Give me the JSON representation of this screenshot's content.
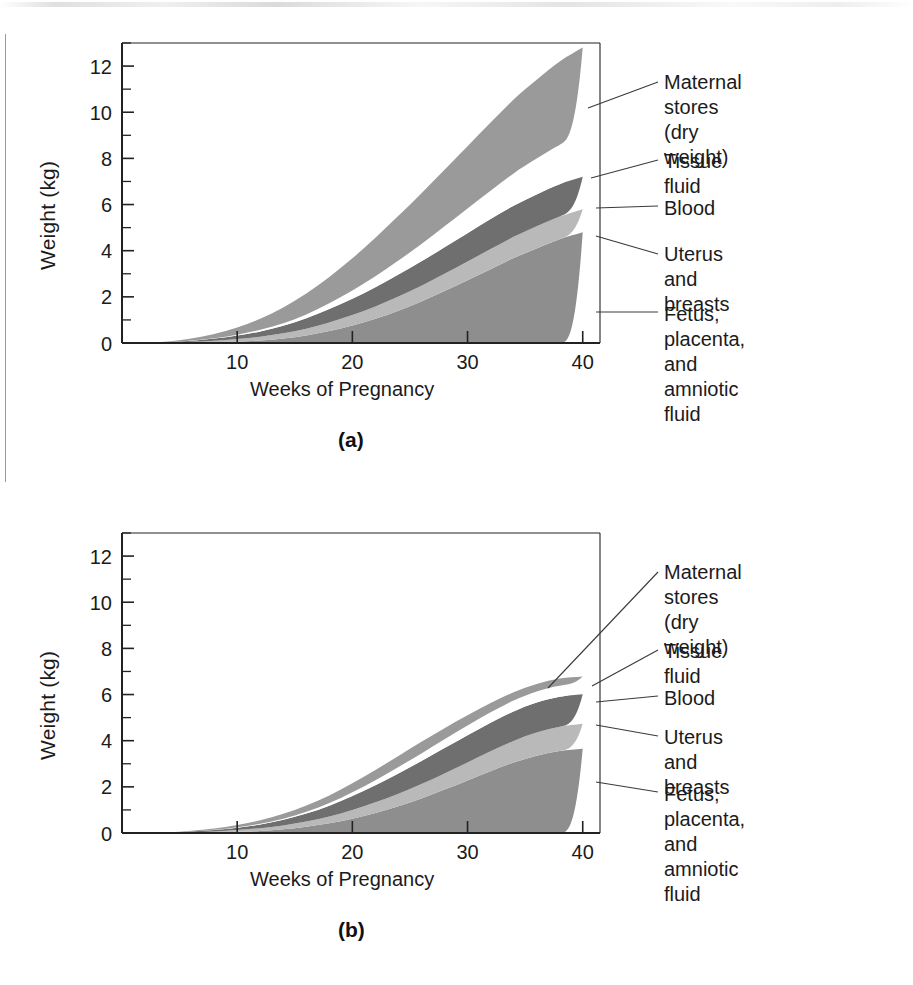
{
  "figure": {
    "panels": [
      {
        "id": "a",
        "caption": "(a)",
        "xlabel": "Weeks of Pregnancy",
        "ylabel": "Weight (kg)"
      },
      {
        "id": "b",
        "caption": "(b)",
        "xlabel": "Weeks of Pregnancy",
        "ylabel": "Weight (kg)"
      }
    ]
  },
  "legend": {
    "entries": [
      {
        "label": "Maternal stores\n(dry weight)",
        "key": "maternal-stores"
      },
      {
        "label": "Tissue fluid",
        "key": "tissue-fluid"
      },
      {
        "label": "Blood",
        "key": "blood"
      },
      {
        "label": "Uterus and breasts",
        "key": "uterus-and-breasts"
      },
      {
        "label": "Fetus, placenta, and\namniotic fluid",
        "key": "fetus-placenta-amniotic-fluid"
      }
    ]
  },
  "colors": {
    "fetus": "#8e8e8e",
    "uterus": "#b9b9b9",
    "blood": "#6f6f6f",
    "tissue_fluid": "#ffffff",
    "maternal_stores": "#9a9a9a",
    "axis": "#222222",
    "text": "#1b1b1b"
  },
  "chart_data": [
    {
      "type": "area",
      "stacked": true,
      "panel": "a",
      "title": "",
      "xlabel": "Weeks of Pregnancy",
      "ylabel": "Weight (kg)",
      "xlim": [
        0,
        41.5
      ],
      "ylim": [
        0,
        13
      ],
      "xticks": [
        10,
        20,
        30,
        40
      ],
      "xtick_labels": [
        "10",
        "20",
        "30",
        "40"
      ],
      "yticks": [
        0,
        2,
        4,
        6,
        8,
        10,
        12
      ],
      "ytick_labels": [
        "0",
        "2",
        "4",
        "6",
        "8",
        "10",
        "12"
      ],
      "y_minor_ticks": [
        1,
        3,
        5,
        7,
        9,
        11,
        13
      ],
      "grid": false,
      "legend_position": "right-outside",
      "x": [
        0,
        4,
        6,
        8,
        10,
        12,
        14,
        16,
        18,
        20,
        22,
        24,
        26,
        28,
        30,
        32,
        34,
        36,
        38,
        40
      ],
      "series": [
        {
          "name": "Fetus, placenta, and amniotic fluid",
          "values": [
            0,
            0,
            0.01,
            0.03,
            0.06,
            0.11,
            0.2,
            0.33,
            0.52,
            0.76,
            1.05,
            1.4,
            1.8,
            2.25,
            2.72,
            3.2,
            3.68,
            4.1,
            4.5,
            4.8
          ]
        },
        {
          "name": "Uterus and breasts",
          "values": [
            0,
            0.02,
            0.04,
            0.07,
            0.11,
            0.16,
            0.22,
            0.29,
            0.37,
            0.45,
            0.53,
            0.61,
            0.68,
            0.75,
            0.81,
            0.87,
            0.92,
            0.96,
            0.98,
            1.0
          ]
        },
        {
          "name": "Blood",
          "values": [
            0,
            0.02,
            0.05,
            0.09,
            0.15,
            0.23,
            0.33,
            0.45,
            0.58,
            0.71,
            0.84,
            0.96,
            1.06,
            1.15,
            1.23,
            1.3,
            1.35,
            1.38,
            1.4,
            1.4
          ]
        },
        {
          "name": "Tissue fluid",
          "values": [
            0,
            0,
            0.01,
            0.02,
            0.04,
            0.07,
            0.11,
            0.17,
            0.25,
            0.35,
            0.47,
            0.6,
            0.75,
            0.91,
            1.07,
            1.23,
            1.4,
            1.55,
            1.7,
            1.8
          ]
        },
        {
          "name": "Maternal stores (dry weight)",
          "values": [
            0,
            0.03,
            0.09,
            0.18,
            0.31,
            0.48,
            0.68,
            0.9,
            1.14,
            1.4,
            1.67,
            1.94,
            2.2,
            2.45,
            2.7,
            2.95,
            3.2,
            3.42,
            3.62,
            3.8
          ]
        }
      ],
      "total_at_40": 12.8
    },
    {
      "type": "area",
      "stacked": true,
      "panel": "b",
      "title": "",
      "xlabel": "Weeks of Pregnancy",
      "ylabel": "Weight (kg)",
      "xlim": [
        0,
        41.5
      ],
      "ylim": [
        0,
        13
      ],
      "xticks": [
        10,
        20,
        30,
        40
      ],
      "xtick_labels": [
        "10",
        "20",
        "30",
        "40"
      ],
      "yticks": [
        0,
        2,
        4,
        6,
        8,
        10,
        12
      ],
      "ytick_labels": [
        "0",
        "2",
        "4",
        "6",
        "8",
        "10",
        "12"
      ],
      "y_minor_ticks": [
        1,
        3,
        5,
        7,
        9,
        11,
        13
      ],
      "grid": false,
      "legend_position": "right-outside",
      "x": [
        0,
        4,
        6,
        8,
        10,
        12,
        14,
        16,
        18,
        20,
        22,
        24,
        26,
        28,
        30,
        32,
        34,
        36,
        38,
        40
      ],
      "series": [
        {
          "name": "Fetus, placenta, and amniotic fluid",
          "values": [
            0,
            0,
            0.01,
            0.02,
            0.05,
            0.09,
            0.16,
            0.27,
            0.42,
            0.62,
            0.87,
            1.16,
            1.5,
            1.88,
            2.28,
            2.68,
            3.05,
            3.35,
            3.55,
            3.65
          ]
        },
        {
          "name": "Uterus and breasts",
          "values": [
            0,
            0.01,
            0.03,
            0.05,
            0.08,
            0.12,
            0.17,
            0.23,
            0.3,
            0.38,
            0.46,
            0.54,
            0.62,
            0.7,
            0.78,
            0.86,
            0.94,
            1.0,
            1.05,
            1.08
          ]
        },
        {
          "name": "Blood",
          "values": [
            0,
            0.01,
            0.03,
            0.06,
            0.1,
            0.16,
            0.24,
            0.34,
            0.46,
            0.6,
            0.74,
            0.88,
            1.0,
            1.1,
            1.18,
            1.24,
            1.28,
            1.3,
            1.3,
            1.28
          ]
        },
        {
          "name": "Tissue fluid",
          "values": [
            0,
            0,
            0.0,
            0.01,
            0.02,
            0.03,
            0.05,
            0.08,
            0.12,
            0.17,
            0.22,
            0.28,
            0.33,
            0.38,
            0.42,
            0.45,
            0.47,
            0.48,
            0.48,
            0.47
          ]
        },
        {
          "name": "Maternal stores (dry weight)",
          "values": [
            0,
            0.01,
            0.03,
            0.06,
            0.1,
            0.15,
            0.21,
            0.27,
            0.33,
            0.39,
            0.44,
            0.48,
            0.5,
            0.48,
            0.44,
            0.4,
            0.36,
            0.33,
            0.31,
            0.3
          ]
        }
      ],
      "total_at_40": 6.78
    }
  ]
}
